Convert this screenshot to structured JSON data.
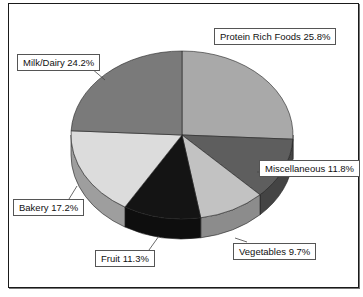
{
  "chart_data": {
    "type": "pie",
    "style": "3d-exploded-none",
    "title": "",
    "categories": [
      "Protein Rich Foods",
      "Miscellaneous",
      "Vegetables",
      "Fruit",
      "Bakery",
      "Milk/Dairy"
    ],
    "values": [
      25.8,
      11.8,
      9.7,
      11.3,
      17.2,
      24.2
    ],
    "unit": "%",
    "labels": [
      {
        "text": "Protein Rich Foods 25.8%",
        "category": "Protein Rich Foods",
        "value": 25.8
      },
      {
        "text": "Miscellaneous 11.8%",
        "category": "Miscellaneous",
        "value": 11.8
      },
      {
        "text": "Vegetables 9.7%",
        "category": "Vegetables",
        "value": 9.7
      },
      {
        "text": "Fruit 11.3%",
        "category": "Fruit",
        "value": 11.3
      },
      {
        "text": "Bakery 17.2%",
        "category": "Bakery",
        "value": 17.2
      },
      {
        "text": "Milk/Dairy 24.2%",
        "category": "Milk/Dairy",
        "value": 24.2
      }
    ],
    "colors": {
      "Protein Rich Foods": "#a9a9a9",
      "Miscellaneous": "#5e5e5e",
      "Vegetables": "#c2c2c2",
      "Fruit": "#141414",
      "Bakery": "#dcdcdc",
      "Milk/Dairy": "#7a7a7a"
    },
    "legend": "none (data labels with leader lines)"
  }
}
